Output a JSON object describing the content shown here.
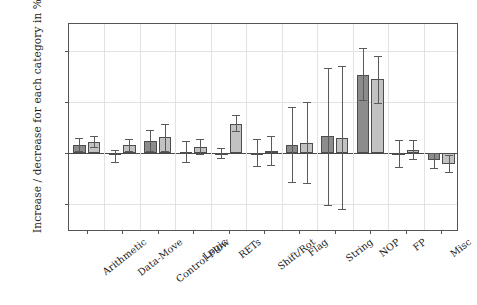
{
  "chart_data": {
    "type": "bar",
    "title": "",
    "xlabel": "",
    "ylabel": "Increase / decrease for each category in %",
    "ylim": [
      -155,
      252
    ],
    "yticks": [
      200,
      100,
      0,
      -100
    ],
    "ytick_labels": [
      "200",
      "100",
      "0",
      "−100"
    ],
    "grid": true,
    "legend": "none",
    "categories": [
      "Arithmetic",
      "Data-Move",
      "Control-Flow",
      "Logic",
      "RETs",
      "Shift/Rot",
      "Flag",
      "String",
      "NOP",
      "FP",
      "Misc"
    ],
    "series": [
      {
        "name": "series-dark",
        "color": "#8c8c8c",
        "values": [
          15,
          -5,
          23,
          2,
          0,
          0,
          16,
          32,
          152,
          -2,
          -15
        ],
        "err_low": [
          4,
          -18,
          3,
          -18,
          -10,
          -26,
          -57,
          -103,
          103,
          -28,
          -30
        ],
        "err_high": [
          28,
          5,
          44,
          24,
          10,
          26,
          90,
          165,
          205,
          25,
          0
        ]
      },
      {
        "name": "series-light",
        "color": "#c2c2c2",
        "values": [
          22,
          15,
          30,
          12,
          57,
          4,
          20,
          29,
          145,
          6,
          -21
        ],
        "err_low": [
          12,
          4,
          3,
          -2,
          42,
          -24,
          -60,
          -110,
          97,
          -12,
          -38
        ],
        "err_high": [
          33,
          27,
          57,
          27,
          73,
          33,
          100,
          170,
          190,
          25,
          -4
        ]
      }
    ]
  },
  "axis": {
    "y_axis_title": "Increase / decrease for each category in %"
  }
}
